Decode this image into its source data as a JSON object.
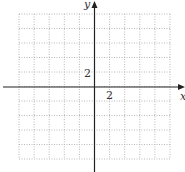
{
  "chart_data": {
    "type": "scatter",
    "title": "",
    "xlabel": "x",
    "ylabel": "y",
    "xlim": [
      -10,
      10
    ],
    "ylim": [
      -10,
      10
    ],
    "grid": true,
    "grid_style": "dotted",
    "grid_step": 2,
    "tick_labels": {
      "x": [
        "2"
      ],
      "y": [
        "2"
      ]
    },
    "series": []
  },
  "axes": {
    "x_label": "x",
    "y_label": "y",
    "x_tick_label": "2",
    "y_tick_label": "2"
  },
  "colors": {
    "axis": "#222222",
    "grid": "#b8b8b8",
    "text": "#333333"
  }
}
